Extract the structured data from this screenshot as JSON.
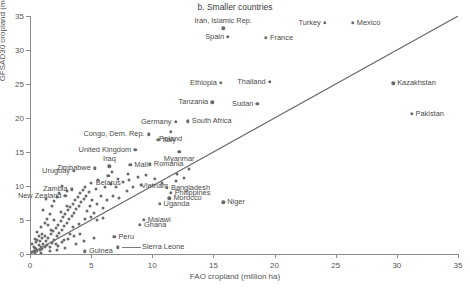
{
  "chart_data": {
    "type": "scatter",
    "title": "b. Smaller countries",
    "xlabel": "FAO cropland (million ha)",
    "ylabel": "GFSAD30 cropland (million ha)",
    "xlim": [
      0,
      35
    ],
    "ylim": [
      0,
      35
    ],
    "xticks": [
      0,
      5,
      10,
      15,
      20,
      25,
      30,
      35
    ],
    "yticks": [
      0,
      5,
      10,
      15,
      20,
      25,
      30,
      35
    ],
    "grid": false,
    "legend": "none",
    "reference_line": {
      "type": "1:1 identity",
      "from": [
        0,
        0
      ],
      "to": [
        35,
        35
      ]
    },
    "marker_color": "#6b6b6b",
    "line_color": "#6b6b6b",
    "labeled_points": [
      {
        "name": "Iran, Islamic Rep.",
        "x": 15.8,
        "y": 33.2,
        "side": "above"
      },
      {
        "name": "Turkey",
        "x": 24.1,
        "y": 34.0,
        "side": "left"
      },
      {
        "name": "Mexico",
        "x": 26.4,
        "y": 34.0,
        "side": "right"
      },
      {
        "name": "Spain",
        "x": 16.2,
        "y": 31.9,
        "side": "left"
      },
      {
        "name": "France",
        "x": 19.3,
        "y": 31.8,
        "side": "right"
      },
      {
        "name": "Ethiopia",
        "x": 15.6,
        "y": 25.2,
        "side": "left"
      },
      {
        "name": "Thailand",
        "x": 19.6,
        "y": 25.3,
        "side": "left"
      },
      {
        "name": "Kazakhstan",
        "x": 29.7,
        "y": 25.1,
        "side": "right"
      },
      {
        "name": "Tanzania",
        "x": 14.9,
        "y": 22.3,
        "side": "left"
      },
      {
        "name": "Sudan",
        "x": 18.6,
        "y": 22.1,
        "side": "left"
      },
      {
        "name": "Pakistan",
        "x": 31.2,
        "y": 20.6,
        "side": "right"
      },
      {
        "name": "Germany",
        "x": 11.9,
        "y": 19.4,
        "side": "left"
      },
      {
        "name": "South Africa",
        "x": 12.9,
        "y": 19.5,
        "side": "right"
      },
      {
        "name": "Poland",
        "x": 11.5,
        "y": 18.0,
        "side": "below"
      },
      {
        "name": "Congo, Dem. Rep.",
        "x": 9.7,
        "y": 17.6,
        "side": "left"
      },
      {
        "name": "Italy",
        "x": 10.5,
        "y": 16.8,
        "side": "right"
      },
      {
        "name": "United Kingdom",
        "x": 8.6,
        "y": 15.3,
        "side": "left"
      },
      {
        "name": "Myanmar",
        "x": 12.2,
        "y": 15.0,
        "side": "below"
      },
      {
        "name": "Zimbabwe",
        "x": 5.3,
        "y": 12.6,
        "side": "left"
      },
      {
        "name": "Iraq",
        "x": 6.5,
        "y": 12.9,
        "side": "above"
      },
      {
        "name": "Mall",
        "x": 8.2,
        "y": 13.1,
        "side": "right"
      },
      {
        "name": "Romania",
        "x": 9.8,
        "y": 13.2,
        "side": "right"
      },
      {
        "name": "Uruguay",
        "x": 3.6,
        "y": 12.2,
        "side": "left"
      },
      {
        "name": "Belarus",
        "x": 6.4,
        "y": 11.5,
        "side": "below"
      },
      {
        "name": "Vietnam",
        "x": 10.2,
        "y": 11.1,
        "side": "below"
      },
      {
        "name": "Zambia",
        "x": 3.4,
        "y": 9.5,
        "side": "left"
      },
      {
        "name": "New Zealand",
        "x": 2.9,
        "y": 8.6,
        "side": "left"
      },
      {
        "name": "Bangladesh",
        "x": 11.2,
        "y": 9.7,
        "side": "right"
      },
      {
        "name": "Philippines",
        "x": 11.5,
        "y": 9.0,
        "side": "right"
      },
      {
        "name": "Morocco",
        "x": 11.4,
        "y": 8.2,
        "side": "right"
      },
      {
        "name": "Uganda",
        "x": 10.6,
        "y": 7.4,
        "side": "right"
      },
      {
        "name": "Niger",
        "x": 15.8,
        "y": 7.6,
        "side": "right"
      },
      {
        "name": "Malawi",
        "x": 9.3,
        "y": 5.0,
        "side": "right"
      },
      {
        "name": "Ghana",
        "x": 9.0,
        "y": 4.3,
        "side": "right"
      },
      {
        "name": "Peru",
        "x": 6.9,
        "y": 2.5,
        "side": "right"
      },
      {
        "name": "Sierra Leone",
        "x": 7.2,
        "y": 1.0,
        "side": "leader-right"
      },
      {
        "name": "Guinea",
        "x": 4.5,
        "y": 0.4,
        "side": "right"
      }
    ],
    "unlabeled_points": [
      [
        0.2,
        0.3
      ],
      [
        0.3,
        0.5
      ],
      [
        0.4,
        0.2
      ],
      [
        0.5,
        0.8
      ],
      [
        0.3,
        1.1
      ],
      [
        0.6,
        0.4
      ],
      [
        0.7,
        1.3
      ],
      [
        0.5,
        1.7
      ],
      [
        0.8,
        0.6
      ],
      [
        0.9,
        1.1
      ],
      [
        0.4,
        2.2
      ],
      [
        1.0,
        0.8
      ],
      [
        1.1,
        1.5
      ],
      [
        0.7,
        2.6
      ],
      [
        1.2,
        1.0
      ],
      [
        1.3,
        1.9
      ],
      [
        0.6,
        3.2
      ],
      [
        1.4,
        1.3
      ],
      [
        1.5,
        2.4
      ],
      [
        0.9,
        4.0
      ],
      [
        1.6,
        1.1
      ],
      [
        1.7,
        2.9
      ],
      [
        1.2,
        4.6
      ],
      [
        1.8,
        1.6
      ],
      [
        1.9,
        3.4
      ],
      [
        1.4,
        5.2
      ],
      [
        2.0,
        2.1
      ],
      [
        2.1,
        3.8
      ],
      [
        1.6,
        5.9
      ],
      [
        2.2,
        2.6
      ],
      [
        2.3,
        4.3
      ],
      [
        1.1,
        6.4
      ],
      [
        2.4,
        3.1
      ],
      [
        2.5,
        4.9
      ],
      [
        1.8,
        7.1
      ],
      [
        2.6,
        3.6
      ],
      [
        2.7,
        5.4
      ],
      [
        2.0,
        7.8
      ],
      [
        2.8,
        4.1
      ],
      [
        2.9,
        5.9
      ],
      [
        2.2,
        8.4
      ],
      [
        3.0,
        4.6
      ],
      [
        3.1,
        6.4
      ],
      [
        2.4,
        9.0
      ],
      [
        3.2,
        5.1
      ],
      [
        3.3,
        6.9
      ],
      [
        1.3,
        8.1
      ],
      [
        3.4,
        5.6
      ],
      [
        3.5,
        7.4
      ],
      [
        2.6,
        10.0
      ],
      [
        3.6,
        6.1
      ],
      [
        3.7,
        7.9
      ],
      [
        3.0,
        9.3
      ],
      [
        3.8,
        6.6
      ],
      [
        3.9,
        8.4
      ],
      [
        4.0,
        7.1
      ],
      [
        4.1,
        8.9
      ],
      [
        4.2,
        7.6
      ],
      [
        4.3,
        9.4
      ],
      [
        4.4,
        8.1
      ],
      [
        4.5,
        9.9
      ],
      [
        4.6,
        8.6
      ],
      [
        4.7,
        6.3
      ],
      [
        4.8,
        9.1
      ],
      [
        4.9,
        7.0
      ],
      [
        5.0,
        10.4
      ],
      [
        5.1,
        8.0
      ],
      [
        5.2,
        6.1
      ],
      [
        5.4,
        9.6
      ],
      [
        5.5,
        7.4
      ],
      [
        5.6,
        10.9
      ],
      [
        5.8,
        8.5
      ],
      [
        6.0,
        6.8
      ],
      [
        6.1,
        9.8
      ],
      [
        6.3,
        7.9
      ],
      [
        6.6,
        10.3
      ],
      [
        6.8,
        8.6
      ],
      [
        7.0,
        9.9
      ],
      [
        7.3,
        8.2
      ],
      [
        7.6,
        10.6
      ],
      [
        7.9,
        9.3
      ],
      [
        8.1,
        10.9
      ],
      [
        8.4,
        9.8
      ],
      [
        8.8,
        11.3
      ],
      [
        9.1,
        10.2
      ],
      [
        9.5,
        11.6
      ],
      [
        1.0,
        3.0
      ],
      [
        1.5,
        4.2
      ],
      [
        2.0,
        5.0
      ],
      [
        2.5,
        6.2
      ],
      [
        3.0,
        7.0
      ],
      [
        3.5,
        3.9
      ],
      [
        4.0,
        4.4
      ],
      [
        4.5,
        5.1
      ],
      [
        5.0,
        5.5
      ],
      [
        5.5,
        5.0
      ],
      [
        6.0,
        5.3
      ],
      [
        2.1,
        1.4
      ],
      [
        2.6,
        1.8
      ],
      [
        3.1,
        2.2
      ],
      [
        3.6,
        2.6
      ],
      [
        4.1,
        3.0
      ],
      [
        0.4,
        0.9
      ],
      [
        0.8,
        1.9
      ],
      [
        1.2,
        2.7
      ],
      [
        1.7,
        3.6
      ],
      [
        2.3,
        1.2
      ],
      [
        2.8,
        2.0
      ],
      [
        3.3,
        2.9
      ],
      [
        0.2,
        1.4
      ],
      [
        0.6,
        2.0
      ],
      [
        1.0,
        2.4
      ],
      [
        5.2,
        2.3
      ],
      [
        4.4,
        1.9
      ],
      [
        3.8,
        1.5
      ],
      [
        2.9,
        0.9
      ],
      [
        2.2,
        0.6
      ],
      [
        1.6,
        0.4
      ],
      [
        0.9,
        0.2
      ],
      [
        13.0,
        12.5
      ],
      [
        12.0,
        11.8
      ],
      [
        10.8,
        10.4
      ],
      [
        11.9,
        10.8
      ],
      [
        12.6,
        11.2
      ],
      [
        8.0,
        11.8
      ],
      [
        7.2,
        11.0
      ],
      [
        6.7,
        12.1
      ]
    ]
  }
}
